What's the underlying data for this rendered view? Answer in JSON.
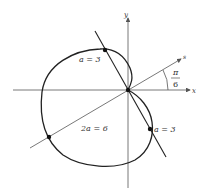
{
  "diagram": {
    "type": "polar-cardioid",
    "axes": {
      "x_label": "x",
      "y_label": "y",
      "rotated_axis_label": "s"
    },
    "angle_label": {
      "numerator": "π",
      "denominator": "6"
    },
    "labels": {
      "upper_point": "a = 3",
      "lower_point": "a = 3",
      "diameter": "2a = 6"
    },
    "colors": {
      "curve": "#222222",
      "axes": "#555555",
      "text": "#333333"
    }
  }
}
